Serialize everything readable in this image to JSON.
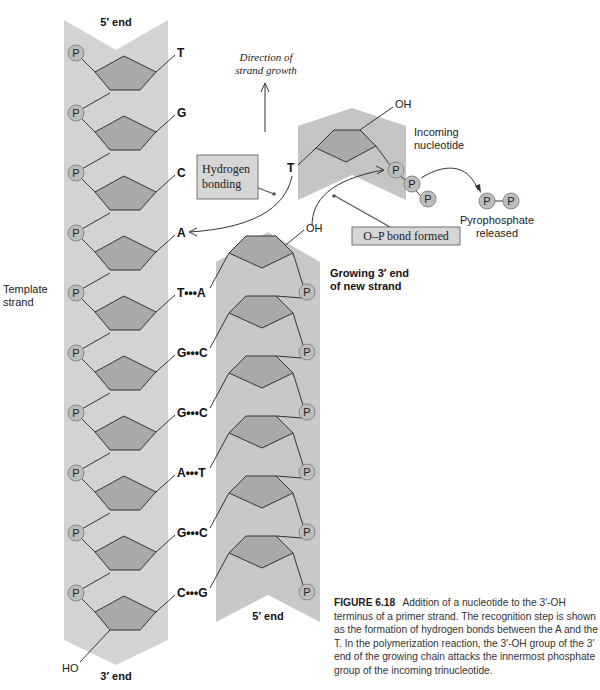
{
  "colors": {
    "strand_band": "#d3d3d3",
    "incoming_band": "#c4c4c4",
    "sugar": "#a9a9a9",
    "phosphate": "#bdbdbd",
    "line": "#333333",
    "box": "#d6d6d6"
  },
  "template_strand": {
    "label_line1": "Template",
    "label_line2": "strand",
    "top_label": "5′ end",
    "bottom_label": "3′ end",
    "hydroxyl": "HO",
    "phosphate_symbol": "P",
    "bases": [
      "T",
      "G",
      "C",
      "A",
      "T",
      "G",
      "G",
      "A",
      "G",
      "C"
    ]
  },
  "new_strand": {
    "label_line1": "Growing 3′ end",
    "label_line2": "of new strand",
    "bottom_label": "5′ end",
    "hydroxyl": "OH",
    "phosphate_symbol": "P",
    "bases": [
      "A",
      "C",
      "C",
      "T",
      "C",
      "G"
    ]
  },
  "base_pairs": [
    {
      "left": "T",
      "dots": "•••",
      "right": "A"
    },
    {
      "left": "G",
      "dots": "•••",
      "right": "C"
    },
    {
      "left": "G",
      "dots": "•••",
      "right": "C"
    },
    {
      "left": "A",
      "dots": "•••",
      "right": "T"
    },
    {
      "left": "G",
      "dots": "•••",
      "right": "C"
    },
    {
      "left": "C",
      "dots": "•••",
      "right": "G"
    }
  ],
  "unpaired_template_bases": [
    "T",
    "G",
    "C",
    "A"
  ],
  "incoming_nucleotide": {
    "label_line1": "Incoming",
    "label_line2": "nucleotide",
    "base": "T",
    "hydroxyl": "OH",
    "phosphates": [
      "P",
      "P",
      "P"
    ]
  },
  "pyrophosphate": {
    "phosphates": [
      "P",
      "P"
    ],
    "label_line1": "Pyrophosphate",
    "label_line2": "released"
  },
  "annotations": {
    "direction_line1": "Direction of",
    "direction_line2": "strand growth",
    "hbond_line1": "Hydrogen",
    "hbond_line2": "bonding",
    "op_bond": "O–P bond formed"
  },
  "caption": {
    "figure_number": "FIGURE 6.18",
    "text": "Addition of a nucleotide to the 3′-OH terminus of a primer strand. The recognition step is shown as the formation of hydrogen bonds between the A and the T. In the polymerization reaction, the 3′-OH group of the 3′ end of the growing chain attacks the innermost phosphate group of the incoming trinucleotide."
  }
}
